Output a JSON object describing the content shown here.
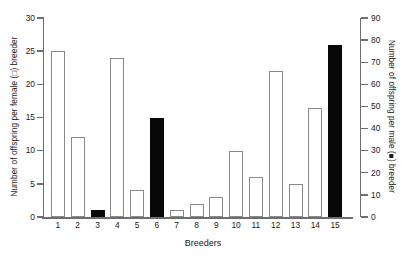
{
  "chart_data": {
    "type": "bar",
    "title": "",
    "xlabel": "Breeders",
    "ylabel": "Number of offspring per female (□) breeder",
    "ylabel_right": "Number of offspring per male (■) breeder",
    "categories": [
      "1",
      "2",
      "3",
      "4",
      "5",
      "6",
      "7",
      "8",
      "9",
      "10",
      "11",
      "12",
      "13",
      "14",
      "15"
    ],
    "values": [
      25,
      12,
      1,
      24,
      4,
      15,
      1,
      2,
      3,
      10,
      6,
      22,
      5,
      16.5,
      26
    ],
    "bar_types": [
      "female",
      "female",
      "male",
      "female",
      "female",
      "male",
      "female",
      "female",
      "female",
      "female",
      "female",
      "female",
      "female",
      "female",
      "male"
    ],
    "ylim": [
      0,
      30
    ],
    "ylim_right": [
      0,
      90
    ],
    "yticks": [
      0,
      5,
      10,
      15,
      20,
      25,
      30
    ],
    "yticks_right": [
      0,
      10,
      20,
      30,
      40,
      50,
      60,
      70,
      80,
      90
    ],
    "yticklabels": [
      "0",
      "5",
      "10",
      "15",
      "20",
      "25",
      "30"
    ],
    "yticklabels_right": [
      "0",
      "10",
      "20",
      "30",
      "40",
      "50",
      "60",
      "70",
      "80",
      "90"
    ],
    "grid": false,
    "legend": "none",
    "series": [
      {
        "name": "female breeders",
        "marker": "□",
        "color": "#ffffff",
        "axis": "left",
        "points": [
          {
            "breeder": "1",
            "value": 25
          },
          {
            "breeder": "2",
            "value": 12
          },
          {
            "breeder": "4",
            "value": 24
          },
          {
            "breeder": "5",
            "value": 4
          },
          {
            "breeder": "7",
            "value": 1
          },
          {
            "breeder": "8",
            "value": 2
          },
          {
            "breeder": "9",
            "value": 3
          },
          {
            "breeder": "10",
            "value": 10
          },
          {
            "breeder": "11",
            "value": 6
          },
          {
            "breeder": "12",
            "value": 22
          },
          {
            "breeder": "13",
            "value": 5
          },
          {
            "breeder": "14",
            "value": 16.5
          }
        ]
      },
      {
        "name": "male breeders",
        "marker": "■",
        "color": "#080808",
        "axis": "right",
        "points": [
          {
            "breeder": "3",
            "value_right": 3,
            "value_left": 1
          },
          {
            "breeder": "6",
            "value_right": 45,
            "value_left": 15
          },
          {
            "breeder": "15",
            "value_right": 78,
            "value_left": 26
          }
        ]
      }
    ]
  },
  "labels": {
    "ylabel_left": "Number of offspring per female (□) breeder",
    "ylabel_right": "Number of offspring per male (■) breeder",
    "xlabel": "Breeders"
  },
  "colors": {
    "female_bar": "#ffffff",
    "female_bar_edge": "#8a8a8a",
    "male_bar": "#080808",
    "axis": "#6e6e6e",
    "text": "#1a1a1a",
    "background": "#ffffff"
  }
}
